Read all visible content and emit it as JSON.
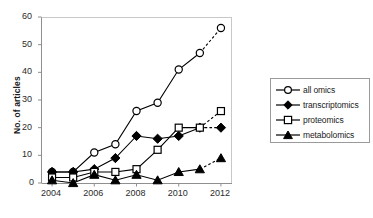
{
  "chart_data": {
    "type": "line",
    "title": "",
    "xlabel": "",
    "ylabel": "No. of articles",
    "x": [
      2004,
      2005,
      2006,
      2007,
      2008,
      2009,
      2010,
      2011,
      2012
    ],
    "xtick_labels": [
      "2004",
      "2006",
      "2008",
      "2010",
      "2012"
    ],
    "xticks": [
      2004,
      2006,
      2008,
      2010,
      2012
    ],
    "xlim": [
      2003.5,
      2012.5
    ],
    "ylim": [
      0,
      60
    ],
    "yticks": [
      0,
      10,
      20,
      30,
      40,
      50,
      60
    ],
    "ytick_labels": [
      "0",
      "10",
      "20",
      "30",
      "40",
      "50",
      "60"
    ],
    "grid": false,
    "legend_position": "right",
    "projected_from": 2011,
    "projected_note": "final segment (2011-2012) drawn dashed",
    "series": [
      {
        "name": "all omics",
        "marker": "open-circle",
        "color": "#000000",
        "values": [
          4,
          4,
          11,
          14,
          26,
          29,
          41,
          47,
          56
        ]
      },
      {
        "name": "transcriptomics",
        "marker": "filled-diamond",
        "color": "#000000",
        "values": [
          4,
          4,
          5,
          9,
          17,
          16,
          17,
          20,
          20
        ]
      },
      {
        "name": "proteomics",
        "marker": "open-square",
        "color": "#000000",
        "values": [
          2,
          2,
          4,
          4,
          5,
          12,
          20,
          20,
          26
        ]
      },
      {
        "name": "metabolomics",
        "marker": "filled-triangle",
        "color": "#000000",
        "values": [
          1,
          0,
          3,
          1,
          3,
          1,
          4,
          5,
          9
        ]
      }
    ]
  },
  "legend": {
    "items": [
      {
        "label": "all omics",
        "marker": "open-circle"
      },
      {
        "label": "transcriptomics",
        "marker": "filled-diamond"
      },
      {
        "label": "proteomics",
        "marker": "open-square"
      },
      {
        "label": "metabolomics",
        "marker": "filled-triangle"
      }
    ]
  },
  "axes": {
    "y_title": "No. of articles"
  },
  "caption": {
    "text": ""
  }
}
